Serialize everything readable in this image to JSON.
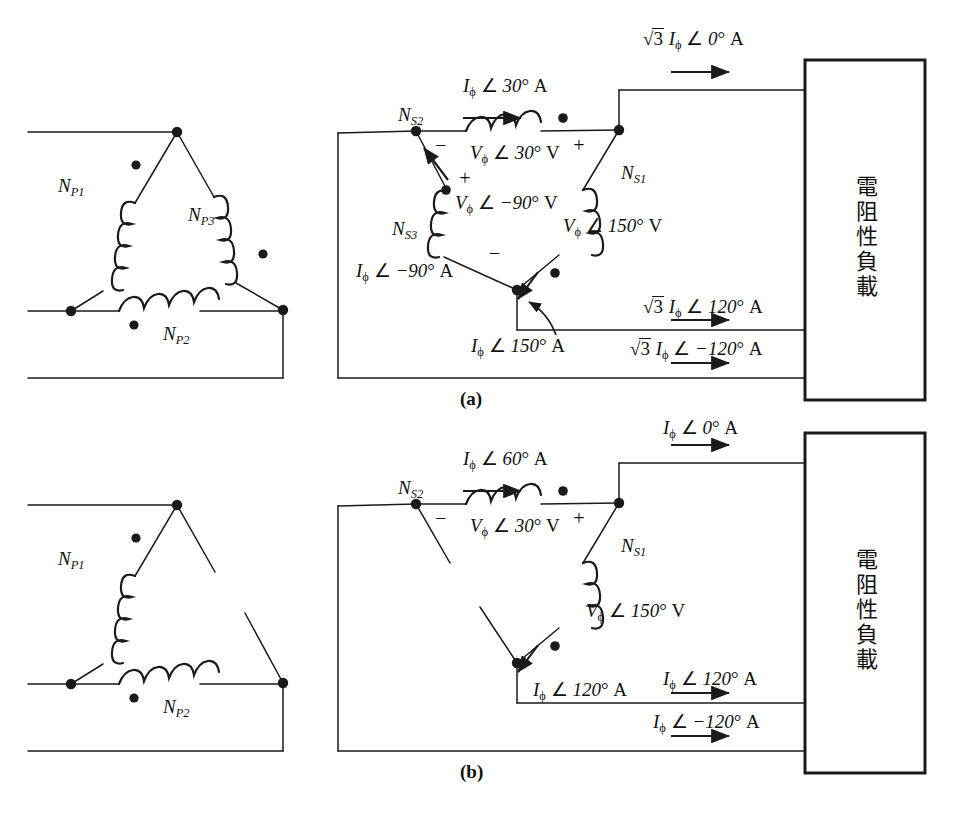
{
  "figure": {
    "captions": {
      "a": "(a)",
      "b": "(b)"
    },
    "load_text": "電阻性負載"
  },
  "symbols": {
    "angle": "∠",
    "phi": "ϕ",
    "degree": "°",
    "sqrt3": "√3",
    "plus": "+",
    "minus": "−",
    "amp": "A",
    "volt": "V"
  },
  "panel_a": {
    "primary": {
      "windings": [
        {
          "id": "NP1",
          "label_main": "N",
          "label_sub": "P1"
        },
        {
          "id": "NP2",
          "label_main": "N",
          "label_sub": "P2"
        },
        {
          "id": "NP3",
          "label_main": "N",
          "label_sub": "P3"
        }
      ]
    },
    "secondary": {
      "windings": [
        {
          "id": "NS1",
          "label_main": "N",
          "label_sub": "S1"
        },
        {
          "id": "NS2",
          "label_main": "N",
          "label_sub": "S2"
        },
        {
          "id": "NS3",
          "label_main": "N",
          "label_sub": "S3"
        }
      ],
      "phase_voltages": [
        {
          "id": "v-30",
          "var": "V",
          "sub": "ϕ",
          "angle": "30°",
          "unit": "V",
          "text": "Vϕ ∠ 30° V"
        },
        {
          "id": "v-m90",
          "var": "V",
          "sub": "ϕ",
          "angle": "−90°",
          "unit": "V",
          "text": "Vϕ ∠ −90° V"
        },
        {
          "id": "v-150",
          "var": "V",
          "sub": "ϕ",
          "angle": "150°",
          "unit": "V",
          "text": "Vϕ ∠ 150° V"
        }
      ],
      "phase_currents": [
        {
          "id": "i-30",
          "angle": "30°",
          "unit": "A",
          "text": "Iϕ ∠ 30° A"
        },
        {
          "id": "i-m90",
          "angle": "−90°",
          "unit": "A",
          "text": "Iϕ ∠ −90° A"
        },
        {
          "id": "i-150",
          "angle": "150°",
          "unit": "A",
          "text": "Iϕ ∠ 150° A"
        }
      ],
      "line_currents": [
        {
          "id": "line-0",
          "prefix": "√3",
          "angle": "0°",
          "unit": "A",
          "text": "√3 Iϕ ∠ 0° A"
        },
        {
          "id": "line-120",
          "prefix": "√3",
          "angle": "120°",
          "unit": "A",
          "text": "√3 Iϕ ∠ 120° A"
        },
        {
          "id": "line-m120",
          "prefix": "√3",
          "angle": "−120°",
          "unit": "A",
          "text": "√3 Iϕ ∠ −120° A"
        }
      ],
      "polarity_marks": [
        {
          "id": "ns2-minus",
          "sign": "−"
        },
        {
          "id": "ns2-plus",
          "sign": "+"
        },
        {
          "id": "ns3-plus",
          "sign": "+"
        },
        {
          "id": "ns3-minus",
          "sign": "−"
        }
      ]
    }
  },
  "panel_b": {
    "primary": {
      "windings": [
        {
          "id": "NP1",
          "label_main": "N",
          "label_sub": "P1"
        },
        {
          "id": "NP2",
          "label_main": "N",
          "label_sub": "P2"
        }
      ]
    },
    "secondary": {
      "windings": [
        {
          "id": "NS1",
          "label_main": "N",
          "label_sub": "S1"
        },
        {
          "id": "NS2",
          "label_main": "N",
          "label_sub": "S2"
        }
      ],
      "phase_voltages": [
        {
          "id": "v-30",
          "angle": "30°",
          "unit": "V",
          "text": "Vϕ ∠ 30° V"
        },
        {
          "id": "v-150",
          "angle": "150°",
          "unit": "V",
          "text": "Vϕ ∠ 150° V"
        }
      ],
      "phase_currents": [
        {
          "id": "i-60",
          "angle": "60°",
          "unit": "A",
          "text": "Iϕ ∠ 60° A"
        },
        {
          "id": "i-120",
          "angle": "120°",
          "unit": "A",
          "text": "Iϕ ∠ 120° A"
        }
      ],
      "line_currents": [
        {
          "id": "line-0",
          "angle": "0°",
          "unit": "A",
          "text": "Iϕ ∠ 0° A"
        },
        {
          "id": "line-120",
          "angle": "120°",
          "unit": "A",
          "text": "Iϕ ∠ 120° A"
        },
        {
          "id": "line-m120",
          "angle": "−120°",
          "unit": "A",
          "text": "Iϕ ∠ −120° A"
        }
      ],
      "polarity_marks": [
        {
          "id": "ns2-minus",
          "sign": "−"
        },
        {
          "id": "ns2-plus",
          "sign": "+"
        }
      ]
    }
  },
  "colors": {
    "line": "#1a1a1a",
    "text": "#111111",
    "background": "#ffffff"
  }
}
